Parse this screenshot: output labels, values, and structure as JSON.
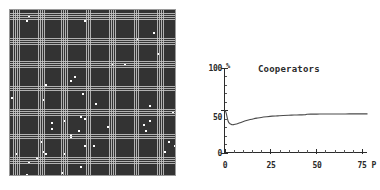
{
  "figure": {
    "panels": [
      "lattice",
      "cooperators-chart"
    ],
    "background_color": "#ffffff"
  },
  "lattice": {
    "name": "spatial-lattice",
    "rows": 80,
    "cols": 80,
    "gridline_color": "#c8c8c8",
    "cell_empty_color": "#ffffff",
    "cell_filled_color": "#333333",
    "border_color": "#9a9a9a",
    "description": "spatial game lattice with clustered occupied cells"
  },
  "chart_data": {
    "type": "line",
    "title": "Cooperators",
    "xlabel": "P",
    "ylabel": "%",
    "xlim": [
      0,
      78
    ],
    "ylim": [
      0,
      100
    ],
    "xticks": [
      0,
      25,
      50,
      75
    ],
    "xtick_labels": [
      "0",
      "25",
      "50",
      "75"
    ],
    "yticks": [
      0,
      50,
      100
    ],
    "ytick_labels": [
      "0",
      "50",
      "100"
    ],
    "x_minor_tick_step": 5,
    "y_minor_tick_step": 10,
    "grid": false,
    "legend": false,
    "line_color": "#4a4a4a",
    "series": [
      {
        "name": "Cooperators",
        "x": [
          0,
          0.5,
          1,
          1.5,
          2,
          2.5,
          3,
          4,
          5,
          6,
          7,
          8,
          9,
          10,
          12,
          14,
          16,
          18,
          20,
          23,
          26,
          29,
          32,
          35,
          38,
          41,
          44,
          45,
          48,
          52,
          56,
          60,
          64,
          68,
          72,
          75,
          78
        ],
        "values": [
          50,
          49,
          46,
          41,
          37,
          35,
          34,
          33,
          33,
          33.5,
          34,
          34.8,
          35.6,
          36.4,
          37.8,
          39,
          40,
          40.8,
          41.5,
          42.3,
          43,
          43.4,
          43.8,
          44.1,
          44.3,
          44.5,
          44.7,
          45.3,
          45.4,
          45.5,
          45.5,
          45.6,
          45.6,
          45.7,
          45.7,
          45.7,
          45.7
        ]
      }
    ]
  },
  "axes_labels": {
    "y_top": "100",
    "y_mid": "50",
    "y_zero": "0",
    "y_unit": "%",
    "x_zero": "0",
    "x_25": "25",
    "x_50": "50",
    "x_75": "75",
    "x_name": "P"
  }
}
